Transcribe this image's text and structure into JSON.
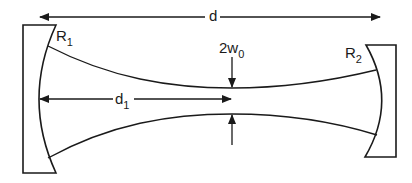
{
  "diagram": {
    "type": "optical-resonator-gaussian-beam",
    "labels": {
      "total_length": "d",
      "mirror1_radius": "R",
      "mirror1_sub": "1",
      "mirror2_radius": "R",
      "mirror2_sub": "2",
      "waist_width": "2w",
      "waist_sub": "0",
      "waist_distance": "d",
      "waist_distance_sub": "1"
    },
    "colors": {
      "stroke": "#1a1a1a",
      "background": "#ffffff"
    }
  }
}
